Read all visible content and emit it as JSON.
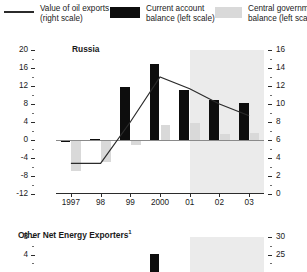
{
  "legend": {
    "items": [
      {
        "icon": "line-swatch",
        "label_line1": "Value of oil exports",
        "label_line2": "(right scale)"
      },
      {
        "icon": "black-square-swatch",
        "label_line1": "Current account",
        "label_line2": "balance (left scale)"
      },
      {
        "icon": "grey-square-swatch",
        "label_line1": "Central government",
        "label_line2": "balance (left scale)"
      }
    ]
  },
  "colors": {
    "black": "#0d0d0d",
    "grey": "#d9d9d9",
    "band": "#ebebeb",
    "axis": "#2b2b2b",
    "zero": "#8a8a8a"
  },
  "chart_data": [
    {
      "type": "bar",
      "title": "Russia",
      "xlabel": "",
      "ylabel": "",
      "categories": [
        "1997",
        "98",
        "99",
        "2000",
        "01",
        "02",
        "03"
      ],
      "x_ticklabels": [
        "1997",
        "98",
        "99",
        "2000",
        "01",
        "02",
        "03"
      ],
      "ylim": [
        -12,
        20
      ],
      "y_ticklabels": [
        "20",
        "16",
        "12",
        "8",
        "4",
        "0",
        "-4",
        "-8",
        "-12"
      ],
      "y2lim": [
        0,
        16
      ],
      "y2_ticklabels": [
        "16",
        "14",
        "12",
        "10",
        "8",
        "6",
        "4",
        "2",
        "0"
      ],
      "grid": false,
      "legend_position": "top",
      "shaded_band": {
        "from": "01.5",
        "to": "03.5",
        "label": "projection"
      },
      "series": [
        {
          "name": "Current account balance (left scale)",
          "type": "bar",
          "color": "#0d0d0d",
          "axis": "left",
          "values": [
            -0.4,
            0.2,
            11.7,
            17.0,
            11.2,
            8.8,
            8.2
          ]
        },
        {
          "name": "Central government balance (left scale)",
          "type": "bar",
          "color": "#d9d9d9",
          "axis": "left",
          "values": [
            -6.8,
            -4.9,
            -1.2,
            3.3,
            3.8,
            1.4,
            1.6
          ]
        },
        {
          "name": "Value of oil exports (right scale)",
          "type": "line",
          "color": "#2b2b2b",
          "axis": "right",
          "values": [
            3.4,
            3.4,
            8.0,
            13.0,
            11.7,
            10.0,
            8.7
          ]
        }
      ]
    },
    {
      "type": "bar",
      "title": "Other Net Energy Exporters",
      "title_superscript": "1",
      "xlabel": "",
      "ylabel": "",
      "categories": [
        "1997",
        "98",
        "99",
        "2000",
        "01",
        "02",
        "03"
      ],
      "ylim": [
        0,
        8
      ],
      "y_ticklabels": [
        "8",
        "4"
      ],
      "y2lim": [
        20,
        30
      ],
      "y2_ticklabels": [
        "30",
        "25"
      ],
      "grid": false,
      "shaded_band": {
        "from": "01.5",
        "to": "03.5",
        "label": "projection"
      },
      "series": [
        {
          "name": "Current account balance (left scale)",
          "type": "bar",
          "color": "#0d0d0d",
          "axis": "left",
          "values": [
            null,
            null,
            null,
            4.2,
            null,
            null,
            null
          ]
        }
      ]
    }
  ]
}
